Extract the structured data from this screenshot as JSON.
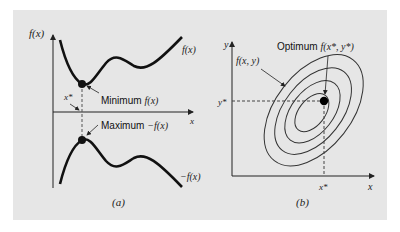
{
  "figure": {
    "background_color": "#e6e6e6",
    "panel_a": {
      "caption": "(a)",
      "y_axis_label": "f(x)",
      "x_axis_label": "x",
      "curve_top_label": "f(x)",
      "curve_bottom_label": "−f(x)",
      "x_star_label": "x*",
      "minimum_label": "Minimum",
      "minimum_func": "f(x)",
      "maximum_label": "Maximum",
      "maximum_func": "−f(x)"
    },
    "panel_b": {
      "caption": "(b)",
      "y_axis_label": "y",
      "x_axis_label": "x",
      "x_star_label": "x*",
      "y_star_label": "y*",
      "surface_label": "f(x, y)",
      "optimum_label": "Optimum",
      "optimum_func": "f(x*, y*)",
      "contour_count": 4
    }
  }
}
